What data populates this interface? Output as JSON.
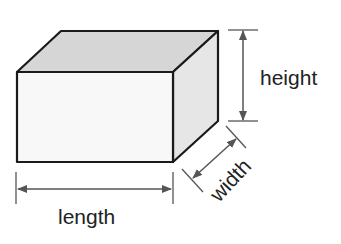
{
  "diagram": {
    "shape": "rectangular-prism",
    "labels": {
      "height": "height",
      "length": "length",
      "width": "width"
    },
    "colors": {
      "outline": "#1a1a1a",
      "front_face": "#f8f8f8",
      "top_face": "#d6d6d6",
      "side_face": "#e6e6e6",
      "dimension_line": "#555555",
      "text": "#222222",
      "background": "#ffffff"
    }
  }
}
